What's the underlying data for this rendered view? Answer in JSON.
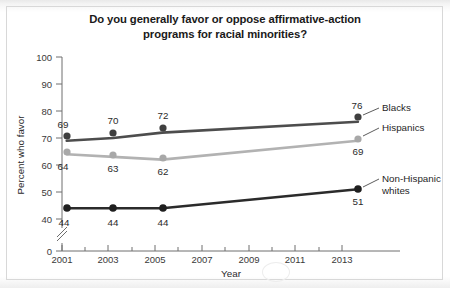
{
  "chart_data": {
    "type": "line",
    "title": "Do you generally favor or oppose affirmative-action programs for racial minorities?",
    "title_line1": "Do you generally favor or oppose affirmative-action",
    "title_line2": "programs for racial minorities?",
    "xlabel": "Year",
    "ylabel": "Percent who favor",
    "x": [
      2001,
      2003,
      2005,
      2013
    ],
    "xlim": [
      2001,
      2014
    ],
    "ylim": [
      40,
      100
    ],
    "y_break_at_zero": true,
    "grid": false,
    "legend_position": "right-inline",
    "xticks": [
      "2001",
      "2003",
      "2005",
      "2007",
      "2009",
      "2011",
      "2013"
    ],
    "xtick_values": [
      2001,
      2003,
      2005,
      2007,
      2009,
      2011,
      2013
    ],
    "yticks": [
      "0",
      "40",
      "50",
      "60",
      "70",
      "80",
      "90",
      "100"
    ],
    "ytick_values": [
      0,
      40,
      50,
      60,
      70,
      80,
      90,
      100
    ],
    "series": [
      {
        "name": "Blacks",
        "color": "#4d4d4d",
        "marker_color": "#3f3f3f",
        "values": [
          69,
          70,
          72,
          76
        ],
        "label_positions": [
          "above-left",
          "above",
          "above",
          "above"
        ],
        "end_label": "76"
      },
      {
        "name": "Hispanics",
        "color": "#b2b2b2",
        "marker_color": "#a8a8a8",
        "values": [
          64,
          63,
          62,
          69
        ],
        "label_positions": [
          "below-left",
          "below",
          "below",
          "below"
        ],
        "end_label": "69"
      },
      {
        "name": "Non-Hispanic whites",
        "name_line1": "Non-Hispanic",
        "name_line2": "whites",
        "color": "#2b2b2b",
        "marker_color": "#1f1f1f",
        "values": [
          44,
          44,
          44,
          51
        ],
        "label_positions": [
          "below",
          "below",
          "below",
          "below"
        ],
        "end_label": "51"
      }
    ]
  }
}
